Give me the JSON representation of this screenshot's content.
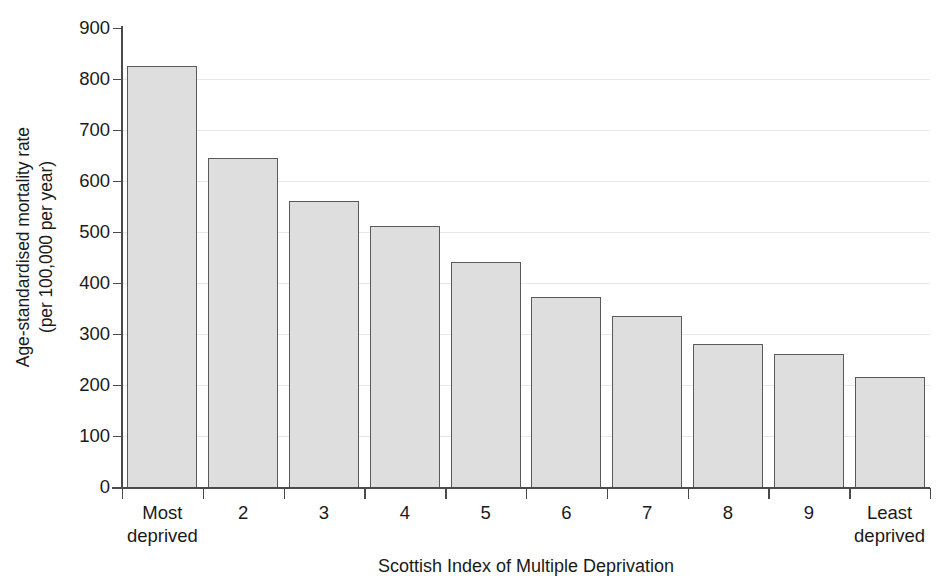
{
  "chart_data": {
    "type": "bar",
    "title": "",
    "subtitle": "",
    "xlabel": "Scottish Index of Multiple Deprivation",
    "ylabel": "Age-standardised mortality rate (per 100,000 per year)",
    "ylabel_line1": "Age-standardised mortality rate",
    "ylabel_line2": "(per 100,000 per year)",
    "categories": [
      "Most deprived",
      "2",
      "3",
      "4",
      "5",
      "6",
      "7",
      "8",
      "9",
      "Least deprived"
    ],
    "category_lines": [
      [
        "Most",
        "deprived"
      ],
      [
        "2"
      ],
      [
        "3"
      ],
      [
        "4"
      ],
      [
        "5"
      ],
      [
        "6"
      ],
      [
        "7"
      ],
      [
        "8"
      ],
      [
        "9"
      ],
      [
        "Least",
        "deprived"
      ]
    ],
    "values": [
      825,
      645,
      560,
      512,
      442,
      372,
      335,
      280,
      260,
      215
    ],
    "ylim": [
      0,
      900
    ],
    "ytick_values": [
      0,
      100,
      200,
      300,
      400,
      500,
      600,
      700,
      800,
      900
    ],
    "ytick_labels": [
      "0",
      "100",
      "200",
      "300",
      "400",
      "500",
      "600",
      "700",
      "800",
      "900"
    ],
    "grid": true,
    "grid_axis": "y",
    "legend": false,
    "legend_position": "none",
    "bar_fill_color": "#dedede",
    "bar_edge_color": "#5a5a5a",
    "axis_color": "#4a4a4a",
    "grid_color": "#e8e8e8",
    "text_color": "#1a1a1a"
  }
}
